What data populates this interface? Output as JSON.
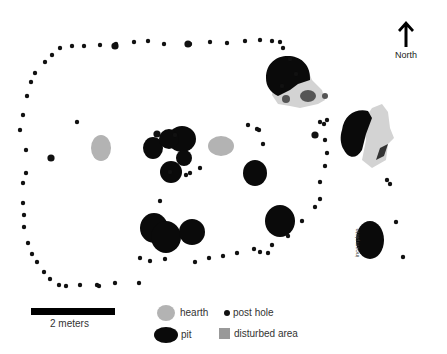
{
  "north_arrow": {
    "label": "North",
    "icon": "north-arrow-icon"
  },
  "annotation": {
    "text": "incomplete"
  },
  "scale_bar": {
    "label": "2 meters"
  },
  "legend": {
    "items": [
      {
        "key": "hearth",
        "label": "hearth",
        "color": "#b3b3b3"
      },
      {
        "key": "post_hole",
        "label": "post hole",
        "color": "#111111"
      },
      {
        "key": "pit",
        "label": "pit",
        "color": "#0a0a0a"
      },
      {
        "key": "disturbed_area",
        "label": "disturbed area",
        "color": "#999999"
      }
    ]
  },
  "colors": {
    "pit": "#0a0a0a",
    "post_hole": "#111111",
    "hearth": "#b3b3b3",
    "disturbed": "#d3d3d3",
    "disturbed_dark": "#7a7a7a"
  },
  "features": {
    "post_holes": [
      [
        35,
        73
      ],
      [
        45,
        62
      ],
      [
        52,
        55
      ],
      [
        60,
        48
      ],
      [
        72,
        46
      ],
      [
        84,
        46
      ],
      [
        100,
        45
      ],
      [
        116,
        44
      ],
      [
        134,
        42
      ],
      [
        148,
        41
      ],
      [
        164,
        44
      ],
      [
        190,
        44
      ],
      [
        210,
        42
      ],
      [
        227,
        43
      ],
      [
        245,
        41
      ],
      [
        260,
        40
      ],
      [
        272,
        41
      ],
      [
        280,
        42
      ],
      [
        283,
        48
      ],
      [
        290,
        59
      ],
      [
        296,
        74
      ],
      [
        282,
        86
      ],
      [
        31,
        82
      ],
      [
        27,
        96
      ],
      [
        23,
        115
      ],
      [
        20,
        130
      ],
      [
        26,
        150
      ],
      [
        26,
        173
      ],
      [
        23,
        183
      ],
      [
        23,
        203
      ],
      [
        24,
        215
      ],
      [
        24,
        227
      ],
      [
        28,
        243
      ],
      [
        32,
        254
      ],
      [
        37,
        262
      ],
      [
        44,
        272
      ],
      [
        50,
        279
      ],
      [
        59,
        285
      ],
      [
        66,
        286
      ],
      [
        80,
        285
      ],
      [
        97,
        285
      ],
      [
        99,
        286
      ],
      [
        115,
        283
      ],
      [
        139,
        283
      ],
      [
        140,
        258
      ],
      [
        150,
        261
      ],
      [
        165,
        259
      ],
      [
        195,
        262
      ],
      [
        209,
        258
      ],
      [
        223,
        256
      ],
      [
        237,
        253
      ],
      [
        254,
        249
      ],
      [
        260,
        252
      ],
      [
        268,
        253
      ],
      [
        272,
        245
      ],
      [
        288,
        236
      ],
      [
        302,
        221
      ],
      [
        315,
        207
      ],
      [
        320,
        199
      ],
      [
        320,
        182
      ],
      [
        325,
        166
      ],
      [
        327,
        153
      ],
      [
        325,
        140
      ],
      [
        320,
        122
      ],
      [
        324,
        124
      ],
      [
        327,
        120
      ],
      [
        77,
        122
      ],
      [
        186,
        175
      ],
      [
        190,
        173
      ],
      [
        200,
        168
      ],
      [
        248,
        125
      ],
      [
        257,
        129
      ],
      [
        259,
        130
      ],
      [
        263,
        144
      ],
      [
        387,
        180
      ],
      [
        390,
        184
      ],
      [
        396,
        222
      ],
      [
        403,
        257
      ],
      [
        175,
        135
      ],
      [
        170,
        172
      ],
      [
        160,
        201
      ]
    ],
    "large_post_holes": [
      [
        115,
        46
      ],
      [
        188,
        44
      ],
      [
        51,
        158
      ],
      [
        157,
        134
      ],
      [
        315,
        135
      ]
    ],
    "hearths": [
      {
        "cx": 101,
        "cy": 148,
        "rx": 10,
        "ry": 13
      },
      {
        "cx": 221,
        "cy": 146,
        "rx": 13,
        "ry": 10
      }
    ],
    "pits": [
      {
        "cx": 153,
        "cy": 148,
        "rx": 10,
        "ry": 11
      },
      {
        "cx": 182,
        "cy": 139,
        "rx": 14,
        "ry": 13
      },
      {
        "cx": 169,
        "cy": 139,
        "rx": 10,
        "ry": 10
      },
      {
        "cx": 184,
        "cy": 158,
        "rx": 8,
        "ry": 8
      },
      {
        "cx": 171,
        "cy": 172,
        "rx": 11,
        "ry": 11
      },
      {
        "cx": 255,
        "cy": 173,
        "rx": 12,
        "ry": 13
      },
      {
        "cx": 154,
        "cy": 228,
        "rx": 14,
        "ry": 15
      },
      {
        "cx": 166,
        "cy": 237,
        "rx": 15,
        "ry": 16
      },
      {
        "cx": 192,
        "cy": 232,
        "rx": 13,
        "ry": 13
      },
      {
        "cx": 280,
        "cy": 221,
        "rx": 15,
        "ry": 16
      },
      {
        "cx": 370,
        "cy": 240,
        "rx": 14,
        "ry": 19
      }
    ]
  }
}
